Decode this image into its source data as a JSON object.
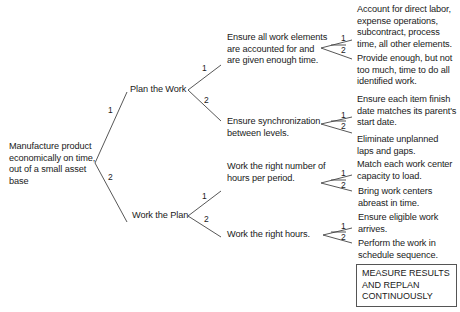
{
  "root": {
    "text": [
      "Manufacture product",
      "economically on time,",
      "out of a small asset",
      "base"
    ]
  },
  "level1": [
    {
      "num": "1",
      "label": "Plan the Work"
    },
    {
      "num": "2",
      "label": "Work the Plan"
    }
  ],
  "level2": [
    {
      "num": "1",
      "lines": [
        "Ensure all work elements",
        "are accounted for and",
        "are given enough time."
      ]
    },
    {
      "num": "2",
      "lines": [
        "Ensure synchronization",
        "between levels."
      ]
    },
    {
      "num": "1",
      "lines": [
        "Work the right number of",
        "hours per period."
      ]
    },
    {
      "num": "2",
      "lines": [
        "Work the right hours."
      ]
    }
  ],
  "level3": [
    {
      "num": "1",
      "lines": [
        "Account for direct labor,",
        "expense operations,",
        "subcontract, process",
        "time, all other elements."
      ]
    },
    {
      "num": "2",
      "lines": [
        "Provide enough, but not",
        "too much, time to do all",
        "identified work."
      ]
    },
    {
      "num": "1",
      "lines": [
        "Ensure each item finish",
        "date matches its parent's",
        "start date."
      ]
    },
    {
      "num": "2",
      "lines": [
        "Eliminate unplanned",
        "laps and gaps."
      ]
    },
    {
      "num": "1",
      "lines": [
        "Match each work center",
        "capacity to load."
      ]
    },
    {
      "num": "2",
      "lines": [
        "Bring work centers",
        "abreast in time."
      ]
    },
    {
      "num": "1",
      "lines": [
        "Ensure eligible work",
        "arrives."
      ]
    },
    {
      "num": "2",
      "lines": [
        "Perform the work in",
        "schedule sequence."
      ]
    }
  ],
  "note_box": {
    "lines": [
      "MEASURE RESULTS",
      "AND REPLAN",
      "CONTINUOUSLY"
    ]
  }
}
